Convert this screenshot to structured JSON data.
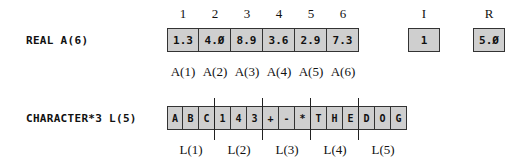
{
  "real_array": {
    "declaration": "REAL A(6)",
    "indices": [
      "1",
      "2",
      "3",
      "4",
      "5",
      "6"
    ],
    "values": [
      "1.3",
      "4.Ø",
      "8.9",
      "3.6",
      "2.9",
      "7.3"
    ],
    "labels": [
      "A(1)",
      "A(2)",
      "A(3)",
      "A(4)",
      "A(5)",
      "A(6)"
    ]
  },
  "scalars": [
    {
      "name": "I",
      "value": "1"
    },
    {
      "name": "R",
      "value": "5.Ø"
    }
  ],
  "char_array": {
    "declaration": "CHARACTER*3 L(5)",
    "chars": [
      "A",
      "B",
      "C",
      "1",
      "4",
      "3",
      "+",
      "-",
      "*",
      "T",
      "H",
      "E",
      "D",
      "O",
      "G"
    ],
    "labels": [
      "L(1)",
      "L(2)",
      "L(3)",
      "L(4)",
      "L(5)"
    ]
  },
  "colors": {
    "cell_fill": "#cfcfcf",
    "border": "#333333"
  }
}
